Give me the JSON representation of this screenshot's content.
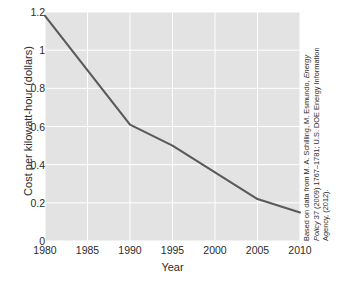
{
  "chart_data": {
    "type": "line",
    "title": "",
    "xlabel": "Year",
    "ylabel": "Cost per kilowatt-hour (dollars)",
    "xlim": [
      1980,
      2010
    ],
    "ylim": [
      0,
      1.2
    ],
    "grid": true,
    "legend": null,
    "xticks": [
      "1980",
      "1985",
      "1990",
      "1995",
      "2000",
      "2005",
      "2010"
    ],
    "xtick_values": [
      1980,
      1985,
      1990,
      1995,
      2000,
      2005,
      2010
    ],
    "yticks": [
      "0",
      "0.2",
      "0.4",
      "0.6",
      "0.8",
      "1",
      "1.2"
    ],
    "ytick_values": [
      0,
      0.2,
      0.4,
      0.6,
      0.8,
      1,
      1.2
    ],
    "series": [
      {
        "name": "Cost per kilowatt-hour",
        "color": "#5a5a5a",
        "x": [
          1980,
          1990,
          1995,
          2000,
          2005,
          2010
        ],
        "values": [
          1.18,
          0.61,
          0.5,
          0.36,
          0.22,
          0.15
        ]
      }
    ]
  },
  "axes": {
    "xlabel": "Year",
    "ylabel": "Cost per kilowatt-hour (dollars)"
  },
  "source_note": {
    "line1_prefix": "Based on data from M. A. Schilling, M. Esmundo, ",
    "line1_italic": "Energy",
    "line2_italic": "Policy",
    "line2_rest": " 37 (2009) 1767–1781; U.S. DOE Energy Information",
    "line3": "Agency, (2012)."
  },
  "colors": {
    "plot_background": "#e3e3e3",
    "gridline": "#ffffff",
    "line": "#5a5a5a",
    "text": "#2b2b2b",
    "page_background": "#ffffff"
  }
}
